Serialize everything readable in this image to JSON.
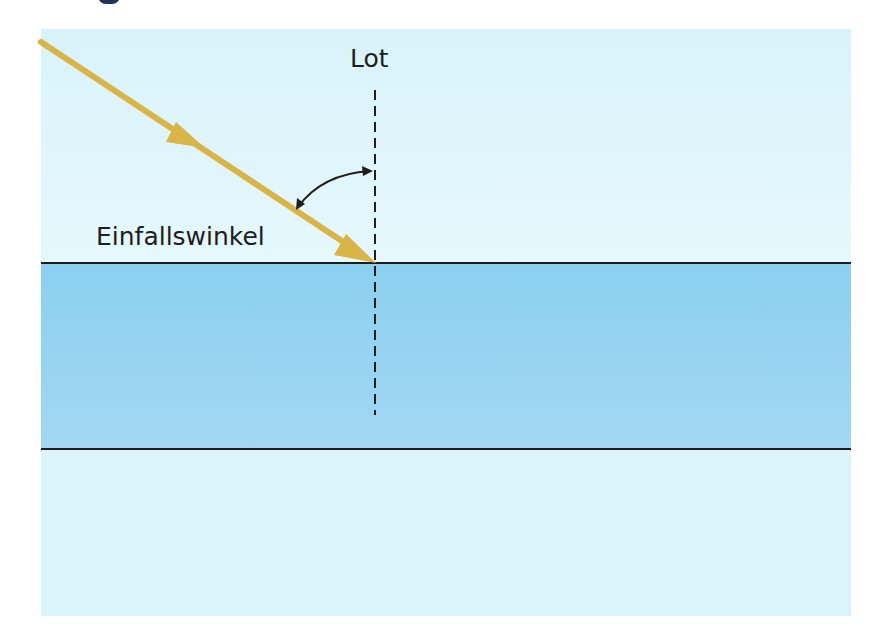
{
  "diagram": {
    "type": "physics-refraction-incidence",
    "labels": {
      "normal": "Lot",
      "angle": "Einfallswinkel"
    },
    "elements": {
      "incident_ray": {
        "color": "#d9b548",
        "arrowheads": 2,
        "direction": "toward interface"
      },
      "normal_line": {
        "style": "dashed",
        "color": "#1e1e1e"
      },
      "angle_arc": {
        "style": "double-headed curved arrow",
        "color": "#1e1e1e"
      },
      "medium_top": {
        "name": "air",
        "color": "#dcf4fb"
      },
      "medium_middle": {
        "name": "water",
        "color": "#94d2f1"
      },
      "medium_bottom": {
        "name": "below",
        "color": "#dbf3fb"
      },
      "interface_lines": 2
    },
    "colors": {
      "ray": "#d9b548",
      "line": "#1e1e1e",
      "air": "#dcf4fb",
      "water": "#94d2f1"
    }
  }
}
